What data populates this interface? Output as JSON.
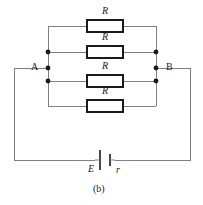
{
  "figure": {
    "caption": "(b)",
    "type": "circuit-diagram",
    "colors": {
      "wire": "#808080",
      "component_outline": "#1a1a1a",
      "node_dot": "#1a1a1a",
      "background": "#ffffff",
      "text": "#1a1a1a"
    }
  },
  "nodes": [
    {
      "id": "A",
      "label": "A",
      "x": 48,
      "y": 68
    },
    {
      "id": "B",
      "label": "B",
      "x": 156,
      "y": 68
    }
  ],
  "junction_dots": [
    {
      "x": 48,
      "y": 52
    },
    {
      "x": 48,
      "y": 68
    },
    {
      "x": 48,
      "y": 81
    },
    {
      "x": 156,
      "y": 52
    },
    {
      "x": 156,
      "y": 68
    },
    {
      "x": 156,
      "y": 81
    }
  ],
  "resistors": [
    {
      "id": "R1",
      "label": "R",
      "branch_y": 26,
      "cx": 105,
      "label_x": 102,
      "label_y": 12
    },
    {
      "id": "R2",
      "label": "R",
      "branch_y": 52,
      "cx": 105,
      "label_x": 102,
      "label_y": 38
    },
    {
      "id": "R3",
      "label": "R",
      "branch_y": 81,
      "cx": 105,
      "label_x": 102,
      "label_y": 67
    },
    {
      "id": "R4",
      "label": "R",
      "branch_y": 106,
      "cx": 105,
      "label_x": 102,
      "label_y": 92
    }
  ],
  "source": {
    "id": "battery",
    "emf_label": "E",
    "internal_resistance_label": "r",
    "x": 105,
    "y": 160,
    "emf_label_x": 90,
    "emf_label_y": 165,
    "r_label_x": 118,
    "r_label_y": 165
  },
  "caption": {
    "text": "(b)",
    "x": 93,
    "y": 188
  },
  "geometry": {
    "left_rail_x": 48,
    "right_rail_x": 156,
    "outer_left_x": 14,
    "outer_right_x": 190,
    "outer_bottom_y": 160,
    "resistor_width": 36,
    "resistor_height": 12
  }
}
